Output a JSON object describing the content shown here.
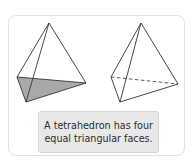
{
  "caption": {
    "line1": "A tetrahedron has four",
    "line2": "equal triangular faces."
  },
  "figures": [
    {
      "name": "tetrahedron-shaded-base",
      "apex": [
        49,
        23
      ],
      "left_base": [
        17,
        77
      ],
      "right_base": [
        86,
        83
      ],
      "front_base": [
        26,
        102
      ],
      "shaded_face_color": "#a9a9a9"
    },
    {
      "name": "tetrahedron-hidden-edge",
      "apex": [
        141,
        23
      ],
      "left_base": [
        111,
        77
      ],
      "right_base": [
        178,
        84
      ],
      "front_base": [
        120,
        102
      ],
      "hidden_edge": "dashed"
    }
  ],
  "colors": {
    "edge": "#333333",
    "card_border": "#e2e2e2",
    "caption_bg": "#e8e8e8",
    "caption_text": "#2b2b2b"
  }
}
